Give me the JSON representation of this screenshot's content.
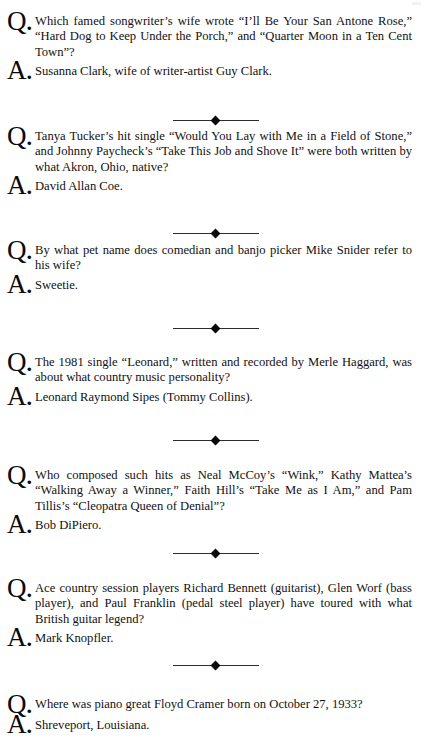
{
  "page": {
    "background_color": "#ffffff",
    "text_color": "#111111",
    "question_marker": "Q.",
    "answer_marker": "A.",
    "ornament": "diamond-rule"
  },
  "entries": [
    {
      "question": "Which famed songwriter’s wife wrote “I’ll Be Your San Antone Rose,” “Hard Dog to Keep Under the Porch,” and “Quarter Moon in a Ten Cent Town”?",
      "answer": "Susanna Clark, wife of writer-artist Guy Clark."
    },
    {
      "question": "Tanya Tucker’s hit single “Would You Lay with Me in a Field of Stone,” and Johnny Paycheck’s “Take This Job and Shove It” were both written by what Akron, Ohio, native?",
      "answer": "David Allan Coe."
    },
    {
      "question": "By what pet name does comedian and banjo picker Mike Snider refer to his wife?",
      "answer": "Sweetie."
    },
    {
      "question": "The 1981 single “Leonard,” written and recorded by Merle Haggard, was about what country music personality?",
      "answer": "Leonard Raymond Sipes (Tommy Collins)."
    },
    {
      "question": "Who composed such hits as Neal McCoy’s “Wink,” Kathy Mattea’s “Walking Away a Winner,” Faith Hill’s “Take Me as I Am,” and Pam Tillis’s “Cleopatra Queen of Denial”?",
      "answer": "Bob DiPiero."
    },
    {
      "question": "Ace country session players Richard Bennett (guitarist), Glen Worf (bass player), and Paul Franklin (pedal steel player) have toured with what British guitar legend?",
      "answer": "Mark Knopfler."
    },
    {
      "question": "Where was piano great Floyd Cramer born on October 27, 1933?",
      "answer": "Shreveport, Louisiana."
    }
  ]
}
